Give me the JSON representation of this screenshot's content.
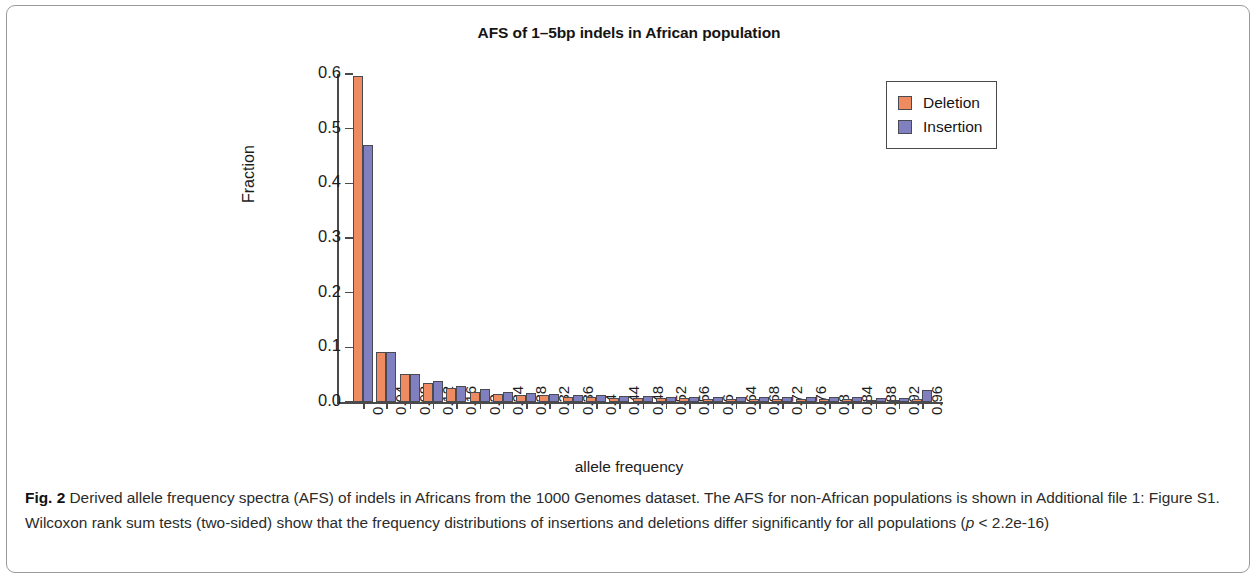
{
  "figure": {
    "label": "Fig. 2",
    "caption_part1": " Derived allele frequency spectra (AFS) of indels in Africans from the 1000 Genomes dataset. The AFS for non-African populations is shown in Additional file 1: Figure S1. Wilcoxon rank sum tests (two-sided) show that the frequency distributions of insertions and deletions differ significantly for all populations (",
    "caption_italic": "p",
    "caption_part2": " < 2.2e-16)"
  },
  "legend": {
    "items": [
      {
        "label": "Deletion",
        "color": "#ef8b60"
      },
      {
        "label": "Insertion",
        "color": "#8080c0"
      }
    ]
  },
  "chart_data": {
    "type": "bar",
    "title": "AFS of 1–5bp indels in African population",
    "xlabel": "allele frequency",
    "ylabel": "Fraction",
    "grid": false,
    "legend_position": "top-right",
    "ylim": [
      0,
      0.6
    ],
    "yticks": [
      "0.0",
      "0.1",
      "0.2",
      "0.3",
      "0.4",
      "0.5",
      "0.6"
    ],
    "ytick_values": [
      0.0,
      0.1,
      0.2,
      0.3,
      0.4,
      0.5,
      0.6
    ],
    "categories": [
      "0",
      "0.04",
      "0.08",
      "0.12",
      "0.16",
      "0.2",
      "0.24",
      "0.28",
      "0.32",
      "0.36",
      "0.4",
      "0.44",
      "0.48",
      "0.52",
      "0.56",
      "0.6",
      "0.64",
      "0.68",
      "0.72",
      "0.76",
      "0.8",
      "0.84",
      "0.88",
      "0.92",
      "0.96"
    ],
    "series": [
      {
        "name": "Deletion",
        "color": "#ef8b60",
        "values": [
          0.597,
          0.092,
          0.051,
          0.034,
          0.025,
          0.019,
          0.015,
          0.013,
          0.012,
          0.01,
          0.009,
          0.008,
          0.008,
          0.007,
          0.007,
          0.006,
          0.006,
          0.006,
          0.005,
          0.005,
          0.005,
          0.005,
          0.004,
          0.004,
          0.005
        ]
      },
      {
        "name": "Insertion",
        "color": "#8080c0",
        "values": [
          0.47,
          0.091,
          0.052,
          0.039,
          0.03,
          0.023,
          0.019,
          0.016,
          0.015,
          0.013,
          0.012,
          0.011,
          0.011,
          0.01,
          0.01,
          0.009,
          0.01,
          0.009,
          0.009,
          0.009,
          0.009,
          0.009,
          0.008,
          0.008,
          0.022
        ]
      }
    ]
  }
}
